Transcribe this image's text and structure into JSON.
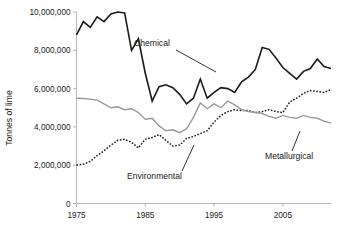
{
  "chart_data": {
    "type": "line",
    "title": "",
    "xlabel": "",
    "ylabel": "Tonnes of lime",
    "xlim": [
      1975,
      2012
    ],
    "ylim": [
      0,
      10000000
    ],
    "grid": false,
    "legend_position": "inline-annotations",
    "x_ticks": [
      "1975",
      "1985",
      "1995",
      "2005"
    ],
    "x_tick_values": [
      1975,
      1985,
      1995,
      2005
    ],
    "y_ticks": [
      "0",
      "2,000,000",
      "4,000,000",
      "6,000,000",
      "8,000,000",
      "10,000,000"
    ],
    "y_tick_values": [
      0,
      2000000,
      4000000,
      6000000,
      8000000,
      10000000
    ],
    "x": [
      1975,
      1976,
      1977,
      1978,
      1979,
      1980,
      1981,
      1982,
      1983,
      1984,
      1985,
      1986,
      1987,
      1988,
      1989,
      1990,
      1991,
      1992,
      1993,
      1994,
      1995,
      1996,
      1997,
      1998,
      1999,
      2000,
      2001,
      2002,
      2003,
      2004,
      2005,
      2006,
      2007,
      2008,
      2009,
      2010,
      2011,
      2012
    ],
    "series": [
      {
        "name": "Chemical",
        "style": "solid",
        "color": "#1a1a1a",
        "width": 1.6,
        "values": [
          8800000,
          9500000,
          9200000,
          9750000,
          9500000,
          9900000,
          10000000,
          9950000,
          8000000,
          8600000,
          6800000,
          5350000,
          6100000,
          6200000,
          6050000,
          5700000,
          5200000,
          5500000,
          6500000,
          5500000,
          5800000,
          6050000,
          6000000,
          5800000,
          6350000,
          6600000,
          7000000,
          8150000,
          8050000,
          7600000,
          7100000,
          6800000,
          6500000,
          6900000,
          7050000,
          7550000,
          7150000,
          7050000
        ]
      },
      {
        "name": "Environmental",
        "style": "dotted",
        "color": "#1a1a1a",
        "width": 1.5,
        "values": [
          2000000,
          2050000,
          2200000,
          2500000,
          2750000,
          3050000,
          3300000,
          3350000,
          3200000,
          2900000,
          3350000,
          3450000,
          3600000,
          3300000,
          3000000,
          3050000,
          3400000,
          3500000,
          3650000,
          3800000,
          4250000,
          4600000,
          4800000,
          4900000,
          4850000,
          4850000,
          4750000,
          4800000,
          4900000,
          4800000,
          4750000,
          5300000,
          5500000,
          5750000,
          5900000,
          5850000,
          5800000,
          5950000
        ]
      },
      {
        "name": "Metallurgical",
        "style": "solid",
        "color": "#999999",
        "width": 1.4,
        "values": [
          5500000,
          5480000,
          5450000,
          5400000,
          5200000,
          5000000,
          5050000,
          4900000,
          4950000,
          4750000,
          4400000,
          4450000,
          4050000,
          3800000,
          3850000,
          3700000,
          3900000,
          4500000,
          5250000,
          4950000,
          5200000,
          5000000,
          5350000,
          5150000,
          4900000,
          4800000,
          4750000,
          4700000,
          4550000,
          4450000,
          4600000,
          4500000,
          4450000,
          4600000,
          4500000,
          4450000,
          4300000,
          4200000
        ]
      }
    ],
    "annotations": [
      {
        "label": "Chemical",
        "target_year": 1995
      },
      {
        "label": "Environmental",
        "target_year": 1992
      },
      {
        "label": "Metallurgical",
        "target_year": 2007
      }
    ]
  }
}
